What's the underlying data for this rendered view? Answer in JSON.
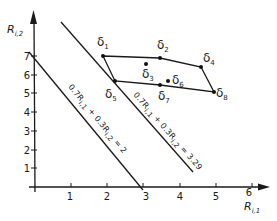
{
  "diagram": {
    "x_axis": {
      "label_main": "R",
      "label_sub": "i,1",
      "ticks": [
        "1",
        "2",
        "3",
        "4",
        "5",
        "6"
      ]
    },
    "y_axis": {
      "label_main": "R",
      "label_sub": "i,2",
      "ticks": [
        "1",
        "2",
        "3",
        "4",
        "5",
        "6",
        "7"
      ]
    },
    "points": [
      {
        "id": "d1",
        "symbol": "δ",
        "sub": "1",
        "x": 1.9,
        "y": 7.0
      },
      {
        "id": "d2",
        "symbol": "δ",
        "sub": "2",
        "x": 3.45,
        "y": 6.9
      },
      {
        "id": "d3",
        "symbol": "δ",
        "sub": "3",
        "x": 3.05,
        "y": 6.6
      },
      {
        "id": "d4",
        "symbol": "δ",
        "sub": "4",
        "x": 4.55,
        "y": 6.45
      },
      {
        "id": "d5",
        "symbol": "δ",
        "sub": "5",
        "x": 2.2,
        "y": 5.7
      },
      {
        "id": "d6",
        "symbol": "δ",
        "sub": "6",
        "x": 3.65,
        "y": 5.7
      },
      {
        "id": "d7",
        "symbol": "δ",
        "sub": "7",
        "x": 3.45,
        "y": 5.5
      },
      {
        "id": "d8",
        "symbol": "δ",
        "sub": "8",
        "x": 4.95,
        "y": 5.1
      }
    ],
    "hull_order": [
      "d1",
      "d2",
      "d4",
      "d8",
      "d7",
      "d5"
    ],
    "lines": [
      {
        "id": "line-2",
        "label": "0.7R",
        "label_sub1": "i,1",
        "mid": " + 0.3R",
        "label_sub2": "i,2",
        "rhs": " = 2",
        "equation": "0.7R_i,1 + 0.3R_i,2 = 2"
      },
      {
        "id": "line-329",
        "label": "0.7R",
        "label_sub1": "i,1",
        "mid": " + 0.3R",
        "label_sub2": "i,2",
        "rhs": " = 3.29",
        "equation": "0.7R_i,1 + 0.3R_i,2 = 3.29"
      }
    ],
    "labels": {
      "d1": "δ",
      "d1_sub": "1",
      "d2": "δ",
      "d2_sub": "2",
      "d3": "δ",
      "d3_sub": "3",
      "d4": "δ",
      "d4_sub": "4",
      "d5": "δ",
      "d5_sub": "5",
      "d6": "δ",
      "d6_sub": "6",
      "d7": "δ",
      "d7_sub": "7",
      "d8": "δ",
      "d8_sub": "8"
    }
  }
}
